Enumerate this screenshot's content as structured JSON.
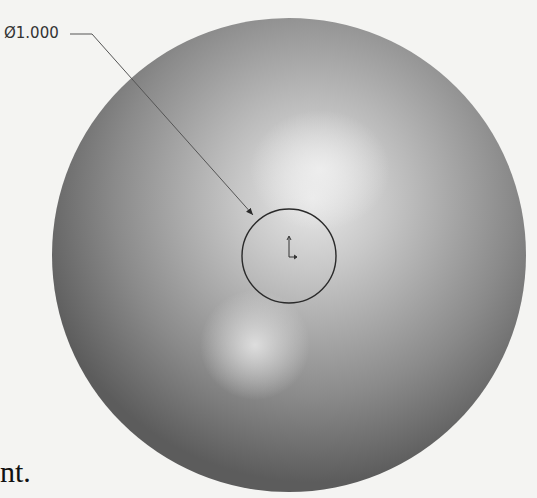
{
  "figure": {
    "dimension_label": "Ø1.000",
    "trailing_text": "nt.",
    "sphere": {
      "cx": 289,
      "cy": 255,
      "r": 237
    },
    "sketch_circle": {
      "cx": 289,
      "cy": 256,
      "r": 47
    },
    "colors": {
      "background": "#f4f4f2",
      "sphere_dark": "#5a5a5a",
      "sphere_light": "#e6e6e6",
      "line": "#2a2a2a"
    }
  }
}
